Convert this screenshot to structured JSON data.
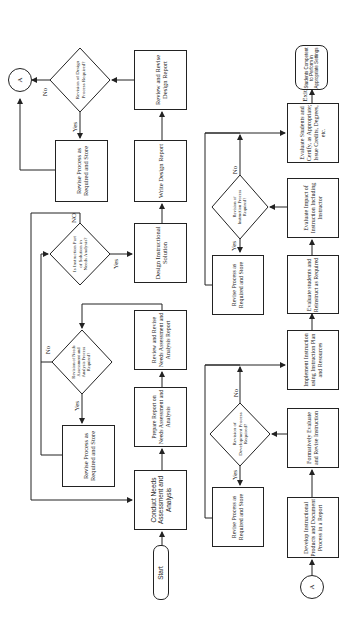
{
  "diagram": {
    "orientation": "rotated 90 degrees counter-clockwise",
    "start": "Start",
    "connector_label": "A",
    "steps": {
      "conduct_needs": "Conduct Needs Assessment and Analysis",
      "prepare_report": "Prepare Report on Needs Assessment and Analysis",
      "review_needs_report": "Review and Revise Needs Assessment and Analysis Report",
      "decision_needs_revision": "Revision of Needs Assessment and Analysis Process Required?",
      "revise_needs": "Revise Process as Required and Store",
      "decision_instruction_part": "Is Instruction Part of Solution in Needs Analysis?",
      "design_solution": "Design Instructional Solution",
      "write_design_report": "Write Design Report",
      "review_design_report": "Review and Revise Design Report",
      "decision_design_revision": "Revision of Design Process Required?",
      "revise_design": "Revise Process as Required and Store",
      "develop_products": "Develop Instructional Products and Document Process in a Report",
      "formatively_evaluate": "Formatively Evaluate and Revise Instruction",
      "decision_development_revision": "Revision of Development Process Required?",
      "revise_development": "Revise Process as Required and Store",
      "implement_instruction": "Implement Instruction using Instruction Plan and Resources",
      "evaluate_reinstruct": "Evaluate students and Reinstruct as Required",
      "evaluate_impact": "Evaluate Impact of Instruction Including Instructor",
      "decision_instruction_revision": "Revision of Instruction Process Required?",
      "revise_instruction": "Revise Process as Required and Store",
      "evaluate_certify": "Evaluate Students and Certify, as Appropriate; Issue Credits, Degrees, etc.",
      "end": "Students Competent to Perform in Appropriate Settings"
    },
    "labels": {
      "yes": "Yes",
      "no": "No",
      "no_caps": "NO",
      "exit": "Exit"
    }
  }
}
